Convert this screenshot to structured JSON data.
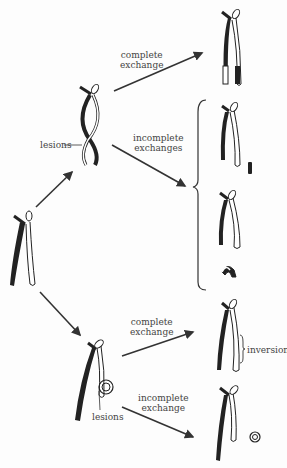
{
  "labels": {
    "top_complete": [
      "complete",
      "exchange"
    ],
    "top_incomplete": [
      "incomplete",
      "exchanges"
    ],
    "top_lesions": "lesions",
    "bottom_complete": [
      "complete",
      "exchange"
    ],
    "bottom_incomplete": [
      "incomplete",
      "exchange"
    ],
    "bottom_lesions": "lesions",
    "inversion": "inversion"
  },
  "colors": {
    "ink": "#222222",
    "arrow": "#333333",
    "text": "#444444"
  }
}
